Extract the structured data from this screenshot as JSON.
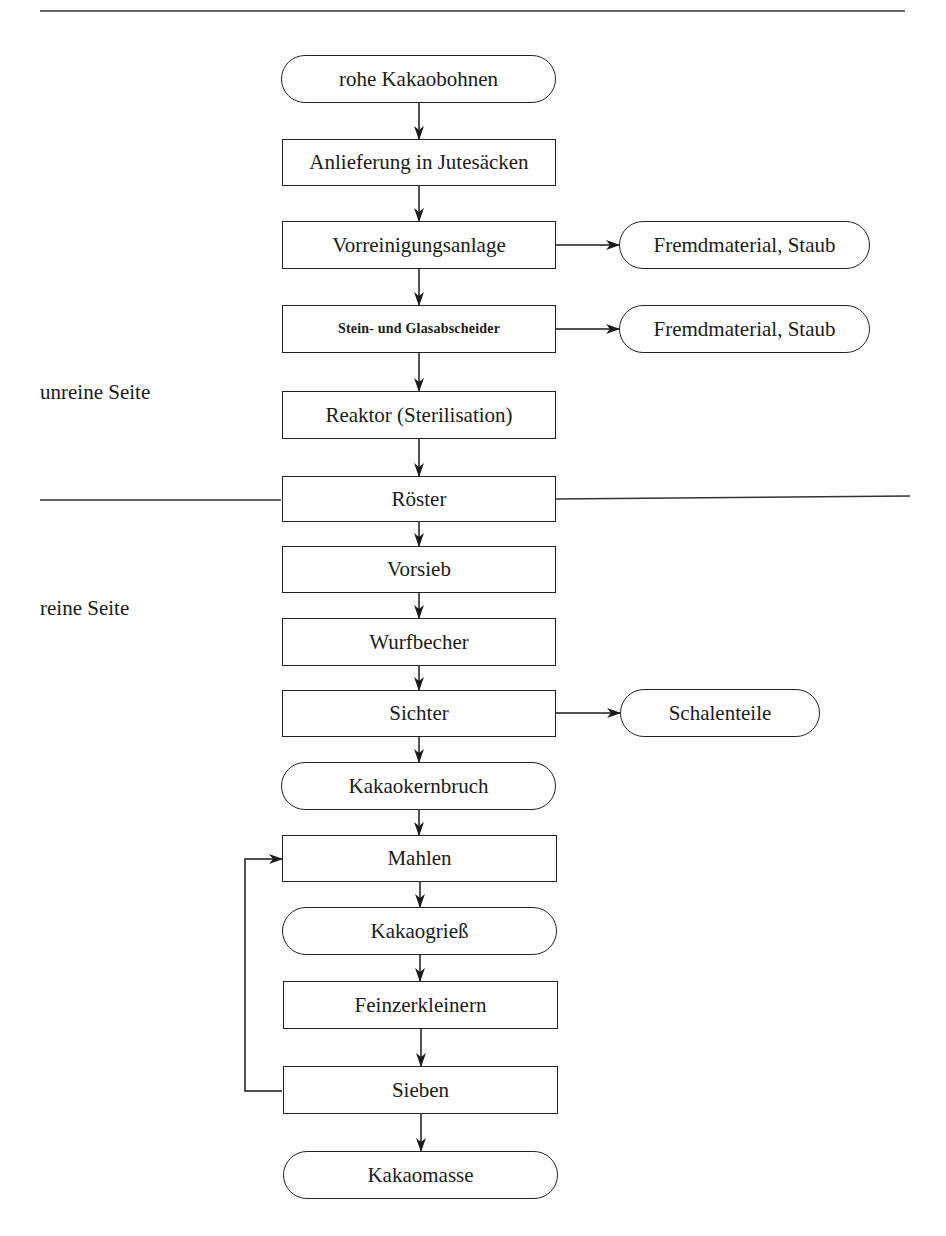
{
  "diagram": {
    "type": "process-flowchart",
    "zones": {
      "upper_label": "unreine Seite",
      "lower_label": "reine Seite"
    },
    "main_flow": [
      {
        "id": "n1",
        "label": "rohe Kakaobohnen",
        "shape": "terminal"
      },
      {
        "id": "n2",
        "label": "Anlieferung in Jutesäcken",
        "shape": "process"
      },
      {
        "id": "n3",
        "label": "Vorreinigungsanlage",
        "shape": "process"
      },
      {
        "id": "n4",
        "label": "Stein- und Glasabscheider",
        "shape": "process"
      },
      {
        "id": "n5",
        "label": "Reaktor (Sterilisation)",
        "shape": "process"
      },
      {
        "id": "n6",
        "label": "Röster",
        "shape": "process"
      },
      {
        "id": "n7",
        "label": "Vorsieb",
        "shape": "process"
      },
      {
        "id": "n8",
        "label": "Wurfbecher",
        "shape": "process"
      },
      {
        "id": "n9",
        "label": "Sichter",
        "shape": "process"
      },
      {
        "id": "n10",
        "label": "Kakaokernbruch",
        "shape": "terminal"
      },
      {
        "id": "n11",
        "label": "Mahlen",
        "shape": "process"
      },
      {
        "id": "n12",
        "label": "Kakaogrieß",
        "shape": "terminal"
      },
      {
        "id": "n13",
        "label": "Feinzerkleinern",
        "shape": "process"
      },
      {
        "id": "n14",
        "label": "Sieben",
        "shape": "process"
      },
      {
        "id": "n15",
        "label": "Kakaomasse",
        "shape": "terminal"
      }
    ],
    "side_outputs": [
      {
        "id": "s1",
        "from": "n3",
        "label": "Fremdmaterial, Staub",
        "shape": "terminal"
      },
      {
        "id": "s2",
        "from": "n4",
        "label": "Fremdmaterial, Staub",
        "shape": "terminal"
      },
      {
        "id": "s3",
        "from": "n9",
        "label": "Schalenteile",
        "shape": "terminal"
      }
    ],
    "feedback": [
      {
        "from": "n14",
        "to": "n11"
      }
    ]
  }
}
